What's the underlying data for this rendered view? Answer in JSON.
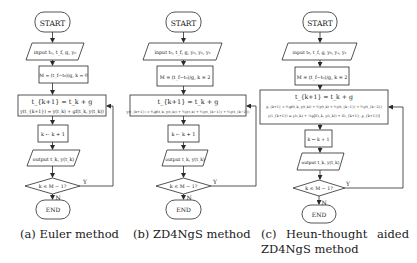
{
  "figures": [
    {
      "id": "a",
      "caption": "(a) Euler method",
      "nodes": {
        "start": "START",
        "input": "input t₀, t_f, g, y₀",
        "init": "M = (t_f−t₀)/g, k = 0",
        "compute_line1": "t_{k+1} = t_k + g",
        "compute_line2": "y(t_{k+1}) = y(t_k) + gf(t_k, y(t_k))",
        "compute_line3": "",
        "update": "k ← k + 1",
        "output": "output t_k, y(t_k)",
        "decision": "k ≤ M − 1?",
        "yes": "Y",
        "no": "N",
        "end": "END"
      }
    },
    {
      "id": "b",
      "caption": "(b) ZD4NgS method",
      "nodes": {
        "start": "START",
        "input": "input t₀, t_f, g, y₀, y₁, y₂",
        "init": "M = (t_f−t₀)/g, k = 2",
        "compute_line1": "t_{k+1} = t_k + g",
        "compute_line2": "y(t_{k+1}) = ⅘gf(t_k, y(t_k)) + ⅗y(t_k) + ⅕y(t_{k−1}) + ⅕y(t_{k−2})",
        "compute_line3": "",
        "update": "k ← k + 1",
        "output": "output t_k, y(t_k)",
        "decision": "k ≤ M − 1?",
        "yes": "Y",
        "no": "N",
        "end": "END"
      }
    },
    {
      "id": "c",
      "caption_line1": "(c) Heun-thought aided",
      "caption_line2": "ZD4NgS method",
      "nodes": {
        "start": "START",
        "input": "input t₀, t_f, g, y₀, y₁, y₂",
        "init": "M = (t_f−t₀)/g, k = 2",
        "compute_line1": "t_{k+1} = t_k + g",
        "compute_line2": "p_{k+1} = ⅘gf(t_k, y(t_k)) + ⅗y(t_k) + ⅕y(t_{k−1}) + ⅕y(t_{k−2})",
        "compute_line3": "y(t_{k+1}) = y(t_k) + ½g[f(t_k, y(t_k)) + f(t_{k+1}, p_{k+1})]",
        "update": "k ← k + 1",
        "output": "output t_k, y(t_k)",
        "decision": "k ≤ M − 1?",
        "yes": "Y",
        "no": "N",
        "end": "END"
      }
    }
  ],
  "colors": {
    "stroke": "#2a2a2a",
    "text": "#1a1a1a",
    "background": "#ffffff"
  }
}
